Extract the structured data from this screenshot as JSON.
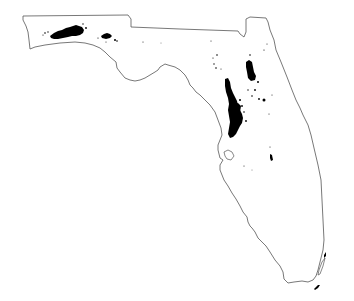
{
  "map": {
    "region": "Florida",
    "type": "state outline with black density clusters",
    "colors": {
      "background": "#ffffff",
      "outline": "#555555",
      "clusters": "#000000"
    },
    "clusters": [
      {
        "name": "western-panhandle-cluster",
        "approx_center": [
          66,
          31
        ]
      },
      {
        "name": "central-panhandle-cluster",
        "approx_center": [
          108,
          37
        ]
      },
      {
        "name": "north-central-ridge-cluster",
        "approx_center": [
          236,
          108
        ]
      },
      {
        "name": "northeast-inland-cluster",
        "approx_center": [
          251,
          70
        ]
      },
      {
        "name": "south-central-speck",
        "approx_center": [
          271,
          157
        ]
      },
      {
        "name": "keys-marks",
        "approx_center": [
          320,
          288
        ]
      }
    ]
  }
}
